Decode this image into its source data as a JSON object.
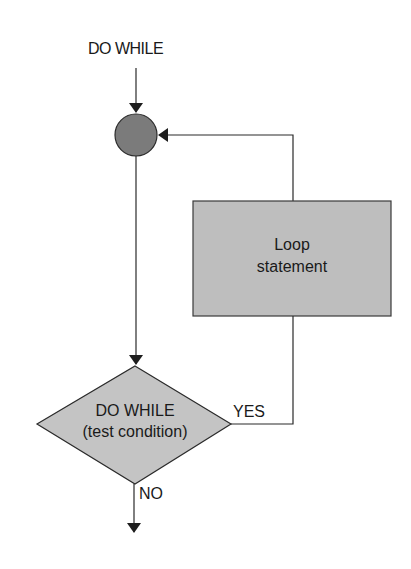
{
  "diagram": {
    "type": "flowchart",
    "title": "DO WHILE",
    "nodes": {
      "start_label": "DO WHILE",
      "junction": {
        "shape": "circle",
        "fill": "#7b7b7b"
      },
      "loop_box": {
        "line1": "Loop",
        "line2": "statement",
        "fill": "#bebebe"
      },
      "decision": {
        "line1": "DO WHILE",
        "line2": "(test condition)",
        "fill": "#c4c4c4"
      }
    },
    "edges": {
      "yes_label": "YES",
      "no_label": "NO"
    },
    "colors": {
      "stroke": "#2a2a2a",
      "text": "#1a1a1a"
    }
  }
}
